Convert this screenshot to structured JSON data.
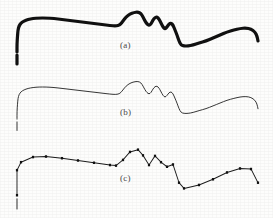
{
  "figure": {
    "kind": "scanned-figure",
    "background_color": "#fdfdfc",
    "ink_color": "#111111",
    "caption_color": "#4a4a4a"
  },
  "panels": [
    {
      "id": "a",
      "label": "(a)",
      "style": "thick-boundary",
      "stroke_width": 3.2,
      "markers": false,
      "description": "Original thick digitized contour"
    },
    {
      "id": "b",
      "label": "(b)",
      "style": "thin-boundary",
      "stroke_width": 0.9,
      "markers": false,
      "description": "Thinned one-pixel-wide contour"
    },
    {
      "id": "c",
      "label": "(c)",
      "style": "polyline-with-dominant-points",
      "stroke_width": 0.9,
      "markers": true,
      "marker_size": 2.2,
      "description": "Polygonal approximation with detected dominant points"
    }
  ],
  "chart_data": {
    "type": "line",
    "title": "",
    "xlabel": "",
    "ylabel": "",
    "grid": false,
    "legend": null,
    "xlim": [
      0,
      273
    ],
    "ylim": [
      0,
      72
    ],
    "note": "Coordinates are in panel-local pixel space; y increases downward as drawn.",
    "curve_points": [
      [
        17,
        52
      ],
      [
        17,
        44
      ],
      [
        17.5,
        36
      ],
      [
        18,
        30
      ],
      [
        19,
        26
      ],
      [
        21,
        23
      ],
      [
        24,
        21
      ],
      [
        28,
        19.5
      ],
      [
        33,
        18.5
      ],
      [
        39,
        18
      ],
      [
        46,
        18
      ],
      [
        54,
        18.5
      ],
      [
        62,
        19.5
      ],
      [
        70,
        20.5
      ],
      [
        78,
        21.5
      ],
      [
        86,
        22.5
      ],
      [
        94,
        23.5
      ],
      [
        102,
        24.5
      ],
      [
        110,
        25.5
      ],
      [
        116,
        26
      ],
      [
        120,
        25
      ],
      [
        123,
        21
      ],
      [
        126,
        17
      ],
      [
        130,
        14
      ],
      [
        134,
        12.5
      ],
      [
        138,
        12
      ],
      [
        141,
        13.5
      ],
      [
        143,
        17
      ],
      [
        145,
        21
      ],
      [
        147,
        24
      ],
      [
        149,
        25.5
      ],
      [
        151,
        24
      ],
      [
        153,
        20
      ],
      [
        155,
        17.5
      ],
      [
        157,
        17
      ],
      [
        159,
        19
      ],
      [
        161,
        23
      ],
      [
        163,
        27
      ],
      [
        165,
        29
      ],
      [
        167,
        27
      ],
      [
        169,
        24
      ],
      [
        171,
        23
      ],
      [
        173,
        25
      ],
      [
        175,
        30
      ],
      [
        177,
        35
      ],
      [
        179,
        41
      ],
      [
        181,
        45
      ],
      [
        184,
        46
      ],
      [
        188,
        46
      ],
      [
        193,
        45
      ],
      [
        199,
        43
      ],
      [
        206,
        41
      ],
      [
        213,
        38
      ],
      [
        220,
        35
      ],
      [
        227,
        32
      ],
      [
        234,
        30
      ],
      [
        240,
        28.5
      ],
      [
        246,
        28
      ],
      [
        251,
        29
      ],
      [
        255,
        32
      ],
      [
        257,
        36
      ],
      [
        258,
        41
      ]
    ],
    "dominant_points": [
      [
        17,
        52
      ],
      [
        17,
        30
      ],
      [
        21,
        23
      ],
      [
        33,
        18.5
      ],
      [
        46,
        18
      ],
      [
        62,
        19.5
      ],
      [
        78,
        21.5
      ],
      [
        94,
        23.5
      ],
      [
        110,
        25.5
      ],
      [
        116,
        26
      ],
      [
        123,
        21
      ],
      [
        130,
        14
      ],
      [
        138,
        12
      ],
      [
        143,
        17
      ],
      [
        149,
        25.5
      ],
      [
        155,
        17.5
      ],
      [
        161,
        23
      ],
      [
        167,
        27
      ],
      [
        173,
        25
      ],
      [
        179,
        41
      ],
      [
        184,
        46
      ],
      [
        199,
        43
      ],
      [
        213,
        38
      ],
      [
        227,
        32
      ],
      [
        240,
        28.5
      ],
      [
        251,
        29
      ],
      [
        258,
        41
      ]
    ],
    "tail_segment": [
      [
        17,
        55
      ],
      [
        17,
        64
      ]
    ]
  }
}
